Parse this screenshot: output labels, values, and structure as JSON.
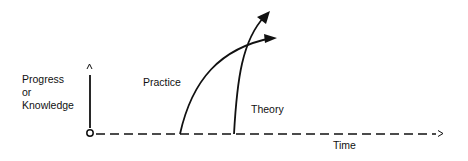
{
  "diagram": {
    "y_axis_label_lines": [
      "Progress",
      "or",
      "Knowledge"
    ],
    "x_axis_label": "Time",
    "curves": [
      {
        "name": "Practice",
        "label": "Practice"
      },
      {
        "name": "Theory",
        "label": "Theory"
      }
    ],
    "colors": {
      "ink": "#111111",
      "background": "#ffffff"
    }
  }
}
